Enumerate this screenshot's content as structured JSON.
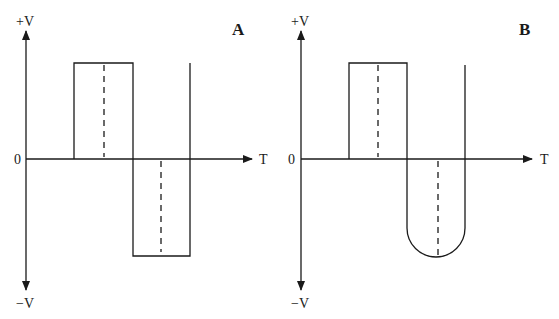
{
  "diagrams": [
    {
      "panel_label": "A",
      "y_axis_top_label": "+V",
      "y_axis_bottom_label": "−V",
      "origin_label": "0",
      "x_axis_label": "T",
      "waveform": "square wave: positive rectangular pulse followed by negative rectangular pulse"
    },
    {
      "panel_label": "B",
      "y_axis_top_label": "+V",
      "y_axis_bottom_label": "−V",
      "origin_label": "0",
      "x_axis_label": "T",
      "waveform": "positive rectangular pulse followed by negative rounded (U-shaped) pulse"
    }
  ],
  "colors": {
    "ink": "#1a1a1a",
    "background": "#ffffff"
  }
}
